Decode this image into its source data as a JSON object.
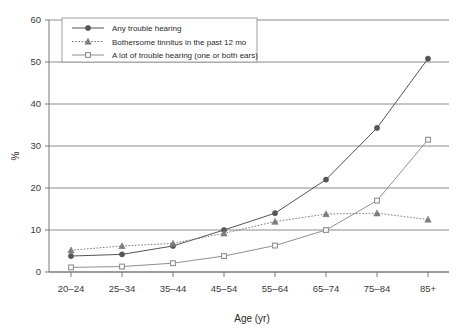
{
  "chart_data": {
    "type": "line",
    "title": "",
    "xlabel": "Age (yr)",
    "ylabel": "%",
    "categories": [
      "20–24",
      "25–34",
      "35–44",
      "45–54",
      "55–64",
      "65–74",
      "75–84",
      "85+"
    ],
    "ylim": [
      0,
      60
    ],
    "yticks": [
      0,
      10,
      20,
      30,
      40,
      50,
      60
    ],
    "ytick_labels": [
      "0",
      "10",
      "20",
      "30",
      "40",
      "50",
      "60"
    ],
    "grid": true,
    "legend_position": "top-left",
    "series": [
      {
        "name": "Any trouble hearing",
        "marker": "circle",
        "line_style": "solid",
        "color": "#555555",
        "values": [
          3.8,
          4.2,
          6.2,
          10.0,
          14.0,
          22.0,
          34.3,
          50.8
        ]
      },
      {
        "name": "Bothersome tinnitus in the past 12 mo",
        "marker": "triangle",
        "line_style": "dotted",
        "color": "#7d7d7d",
        "values": [
          5.2,
          6.2,
          6.8,
          9.2,
          12.0,
          13.8,
          14.0,
          12.5
        ]
      },
      {
        "name": "A lot of trouble hearing (one or both ears)",
        "marker": "square",
        "line_style": "solid-light",
        "color": "#909090",
        "values": [
          1.1,
          1.3,
          2.1,
          3.8,
          6.3,
          10.0,
          17.0,
          31.5
        ]
      }
    ]
  },
  "legend": {
    "items": [
      "Any trouble hearing",
      "Bothersome tinnitus in the past 12 mo",
      "A lot of trouble hearing (one or both ears)"
    ]
  },
  "axes": {
    "y_title": "%",
    "x_title": "Age (yr)"
  }
}
